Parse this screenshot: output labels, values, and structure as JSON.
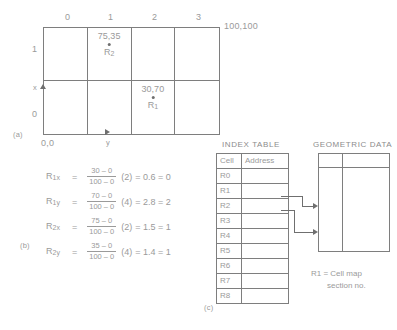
{
  "figure": {
    "panel_a_label": "(a)",
    "panel_b_label": "(b)",
    "panel_c_label": "(c)"
  },
  "grid": {
    "col_labels": [
      "0",
      "1",
      "2",
      "3"
    ],
    "row_labels": [
      "1",
      "0"
    ],
    "origin_label": "0,0",
    "max_label": "100,100",
    "x_axis_label": "x",
    "y_axis_label": "y",
    "points": [
      {
        "coord": "75,35",
        "name": "R",
        "subscript": "2",
        "col": 1,
        "row": 0
      },
      {
        "coord": "30,70",
        "name": "R",
        "subscript": "1",
        "col": 2,
        "row": 1
      }
    ]
  },
  "equations": [
    {
      "lhs": "R",
      "lhs_sub": "1x",
      "numerator": "30 – 0",
      "denominator": "100 – 0",
      "multiplier": "(2)",
      "result": "= 0.6 = 0"
    },
    {
      "lhs": "R",
      "lhs_sub": "1y",
      "numerator": "70 – 0",
      "denominator": "100 – 0",
      "multiplier": "(4)",
      "result": "= 2.8 = 2"
    },
    {
      "lhs": "R",
      "lhs_sub": "2x",
      "numerator": "75 – 0",
      "denominator": "100 – 0",
      "multiplier": "(2)",
      "result": "= 1.5 = 1"
    },
    {
      "lhs": "R",
      "lhs_sub": "2y",
      "numerator": "35 – 0",
      "denominator": "100 – 0",
      "multiplier": "(4)",
      "result": "= 1.4 = 1"
    }
  ],
  "index_table": {
    "title": "INDEX TABLE",
    "headers": [
      "Cell",
      "Address"
    ],
    "rows": [
      {
        "cell": "R0",
        "address": ""
      },
      {
        "cell": "R1",
        "address": ""
      },
      {
        "cell": "R2",
        "address": ""
      },
      {
        "cell": "R3",
        "address": ""
      },
      {
        "cell": "R4",
        "address": ""
      },
      {
        "cell": "R5",
        "address": ""
      },
      {
        "cell": "R6",
        "address": ""
      },
      {
        "cell": "R7",
        "address": ""
      },
      {
        "cell": "R8",
        "address": ""
      }
    ]
  },
  "geometric_data": {
    "title": "GEOMETRIC DATA",
    "caption_line1": "R1 = Cell map",
    "caption_line2": "section no."
  }
}
